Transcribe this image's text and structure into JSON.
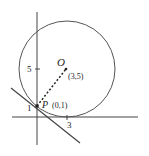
{
  "diagram": {
    "type": "circle-tangent",
    "center": {
      "label": "O",
      "coords": "(3,5)"
    },
    "point": {
      "label": "P",
      "coords": "(0,1)"
    },
    "y_ticks": [
      {
        "label": "5"
      },
      {
        "label": "1"
      }
    ],
    "x_ticks": [
      {
        "label": "3"
      }
    ],
    "colors": {
      "stroke": "#444444",
      "text": "#222222"
    }
  }
}
